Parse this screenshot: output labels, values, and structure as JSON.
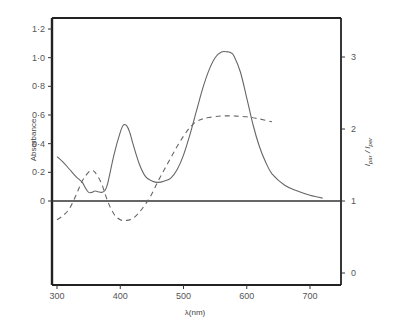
{
  "chart_data": {
    "type": "line",
    "title": "",
    "xlabel": "λ (nm)",
    "ylabel": "Absorbance",
    "y2label": "I par / I per",
    "xlim": [
      292,
      750
    ],
    "ylim": [
      -0.5,
      1.28
    ],
    "y2lim": [
      -0.04,
      3.8
    ],
    "grid": false,
    "legend": "none",
    "x_ticks": [
      300,
      400,
      500,
      600,
      700
    ],
    "y_ticks": [
      {
        "value": 0,
        "label": "0"
      },
      {
        "value": 0.2,
        "label": "0·2"
      },
      {
        "value": 0.4,
        "label": "0·4"
      },
      {
        "value": 0.6,
        "label": "0·6"
      },
      {
        "value": 0.8,
        "label": "0·8"
      },
      {
        "value": 1.0,
        "label": "1·0"
      },
      {
        "value": 1.2,
        "label": "1·2"
      }
    ],
    "y2_ticks": [
      {
        "value": 0,
        "label": "0"
      },
      {
        "value": 1,
        "label": "1"
      },
      {
        "value": 2,
        "label": "2"
      },
      {
        "value": 3,
        "label": "3"
      }
    ],
    "reference_line": {
      "axis": "y",
      "value": 0,
      "note": "Absorbance 0 coincides with I par/I per = 1"
    },
    "series": [
      {
        "name": "Absorbance",
        "axis": "left",
        "style": "solid",
        "x": [
          292,
          300,
          310,
          320,
          330,
          340,
          345,
          350,
          355,
          360,
          365,
          370,
          375,
          380,
          390,
          400,
          405,
          410,
          415,
          420,
          430,
          440,
          450,
          460,
          470,
          480,
          490,
          500,
          510,
          520,
          530,
          540,
          550,
          560,
          570,
          575,
          580,
          590,
          600,
          610,
          620,
          630,
          640,
          660,
          680,
          700,
          720,
          750
        ],
        "values": [
          0.32,
          0.31,
          0.27,
          0.22,
          0.17,
          0.13,
          0.09,
          0.06,
          0.06,
          0.07,
          0.065,
          0.06,
          0.07,
          0.12,
          0.32,
          0.48,
          0.53,
          0.525,
          0.48,
          0.4,
          0.26,
          0.17,
          0.14,
          0.13,
          0.14,
          0.16,
          0.22,
          0.32,
          0.46,
          0.62,
          0.78,
          0.91,
          1.0,
          1.04,
          1.04,
          1.035,
          1.01,
          0.9,
          0.72,
          0.53,
          0.38,
          0.27,
          0.19,
          0.11,
          0.07,
          0.04,
          0.02,
          0.0
        ]
      },
      {
        "name": "I par / I per",
        "axis": "right",
        "style": "dashed",
        "x": [
          292,
          300,
          310,
          320,
          330,
          340,
          350,
          355,
          360,
          370,
          380,
          390,
          400,
          410,
          420,
          430,
          440,
          450,
          460,
          470,
          480,
          490,
          500,
          510,
          520,
          530,
          540,
          560,
          580,
          600,
          620,
          640
        ],
        "values": [
          0.72,
          0.74,
          0.8,
          0.9,
          1.08,
          1.28,
          1.4,
          1.42,
          1.4,
          1.25,
          1.0,
          0.82,
          0.74,
          0.73,
          0.76,
          0.84,
          0.96,
          1.1,
          1.28,
          1.44,
          1.6,
          1.76,
          1.9,
          2.02,
          2.1,
          2.14,
          2.16,
          2.18,
          2.18,
          2.17,
          2.14,
          2.1
        ]
      }
    ]
  },
  "labels": {
    "ylabel": "Absorbance",
    "xlabel": "λ(nm)",
    "y2label_main": "I",
    "y2label_sub1": "par",
    "y2label_sep": " / I",
    "y2label_sub2": "per"
  }
}
